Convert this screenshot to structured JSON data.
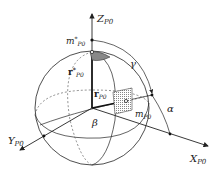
{
  "diagram": {
    "type": "sphere-coordinate-system",
    "axes": {
      "z": {
        "label": "Z",
        "subscript": "P0"
      },
      "x": {
        "label": "X",
        "subscript": "P0"
      },
      "y": {
        "label": "Y",
        "subscript": "P0"
      }
    },
    "points": {
      "m_star": {
        "label": "m",
        "superscript": "*",
        "subscript": "P0"
      },
      "m": {
        "label": "m",
        "subscript": "P0"
      }
    },
    "vectors": {
      "r_star": {
        "label": "r",
        "superscript": "*",
        "subscript": "P0"
      },
      "r": {
        "label": "r",
        "subscript": "P0"
      }
    },
    "angles": {
      "gamma": "γ",
      "alpha": "α",
      "beta": "β"
    },
    "colors": {
      "line": "#222222",
      "shade": "#999999",
      "hatch": "#bbbbbb"
    }
  }
}
